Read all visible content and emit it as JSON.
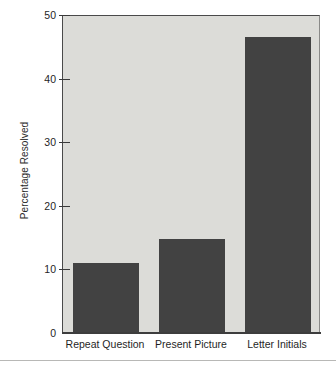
{
  "chart_data": {
    "type": "bar",
    "title": "",
    "xlabel": "",
    "ylabel": "Percentage Resolved",
    "categories": [
      "Repeat Question",
      "Present Picture",
      "Letter Initials"
    ],
    "values": [
      11.0,
      14.8,
      46.6
    ],
    "ylim": [
      0,
      50
    ],
    "yticks": [
      0,
      10,
      20,
      30,
      40,
      50
    ],
    "ytick_labels": [
      "0",
      "10",
      "20",
      "30",
      "40",
      "50"
    ],
    "grid": false,
    "legend": null,
    "series": [
      {
        "name": "Percentage Resolved",
        "values": [
          11.0,
          14.8,
          46.6
        ]
      }
    ],
    "colors": {
      "bar_fill": "#424242",
      "plot_background": "#dcdcd8",
      "axis_line": "#3d3d3d",
      "text": "#1f1f1f",
      "page_background": "#ffffff"
    }
  }
}
